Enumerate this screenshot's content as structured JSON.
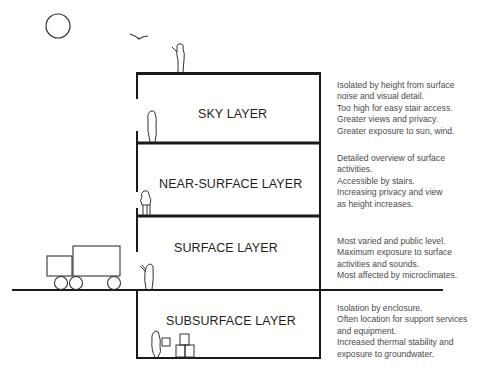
{
  "colors": {
    "line": "#1a1a1a",
    "label_text": "#1e1e1e",
    "desc_text": "#4a4a4a",
    "background": "#ffffff"
  },
  "layers": [
    {
      "name": "SKY LAYER",
      "description": [
        "Isolated by height from surface",
        "noise and visual detail.",
        "Too high for easy stair access.",
        "Greater views and privacy.",
        "Greater exposure to sun, wind."
      ]
    },
    {
      "name": "NEAR-SURFACE LAYER",
      "description": [
        "Detailed overview of surface",
        "activities.",
        "Accessible by stairs.",
        "Increasing privacy and view",
        "as height increases."
      ]
    },
    {
      "name": "SURFACE LAYER",
      "description": [
        "Most varied and public level.",
        "Maximum exposure to surface",
        "activities and sounds.",
        "Most affected by microclimates."
      ]
    },
    {
      "name": "SUBSURFACE LAYER",
      "description": [
        "Isolation by enclosure.",
        "Often location for support services",
        "and equipment.",
        "Increased thermal stability and",
        "exposure to groundwater."
      ]
    }
  ],
  "icons": [
    "sun-icon",
    "bird-icon",
    "person-icon",
    "truck-icon",
    "box-icon"
  ]
}
